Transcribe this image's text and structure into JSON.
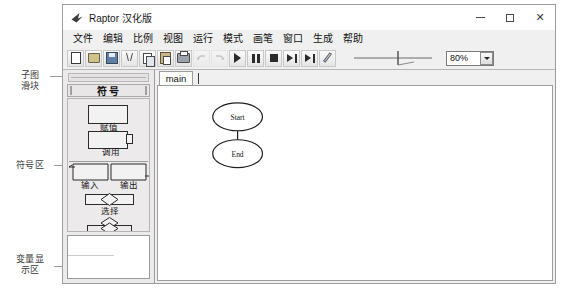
{
  "window": {
    "title": "Raptor 汉化版",
    "icon": "raptor-bird-icon",
    "controls": {
      "minimize": "minimize-icon",
      "maximize": "maximize-icon",
      "close": "✕"
    }
  },
  "menu": {
    "items": [
      {
        "label": "文件",
        "name": "menu-file"
      },
      {
        "label": "编辑",
        "name": "menu-edit"
      },
      {
        "label": "比例",
        "name": "menu-scale"
      },
      {
        "label": "视图",
        "name": "menu-view"
      },
      {
        "label": "运行",
        "name": "menu-run"
      },
      {
        "label": "模式",
        "name": "menu-mode"
      },
      {
        "label": "画笔",
        "name": "menu-pen"
      },
      {
        "label": "窗口",
        "name": "menu-window"
      },
      {
        "label": "生成",
        "name": "menu-generate"
      },
      {
        "label": "帮助",
        "name": "menu-help"
      }
    ]
  },
  "toolbar": {
    "buttons": [
      {
        "name": "new-file-button",
        "icon": "page-icon",
        "enabled": true
      },
      {
        "name": "open-file-button",
        "icon": "folder-open-icon",
        "enabled": true
      },
      {
        "name": "save-button",
        "icon": "floppy-disk-icon",
        "enabled": true
      },
      {
        "name": "cut-button",
        "icon": "scissors-icon",
        "enabled": true
      },
      {
        "name": "copy-button",
        "icon": "copy-icon",
        "enabled": true
      },
      {
        "name": "paste-button",
        "icon": "clipboard-icon",
        "enabled": true
      },
      {
        "name": "print-button",
        "icon": "printer-icon",
        "enabled": true
      },
      {
        "name": "undo-button",
        "icon": "undo-arrow-icon",
        "enabled": false
      },
      {
        "name": "redo-button",
        "icon": "redo-arrow-icon",
        "enabled": false
      },
      {
        "name": "run-button",
        "icon": "play-icon",
        "enabled": true
      },
      {
        "name": "pause-button",
        "icon": "pause-icon",
        "enabled": true
      },
      {
        "name": "stop-button",
        "icon": "stop-icon",
        "enabled": true
      },
      {
        "name": "step-button",
        "icon": "step-over-icon",
        "enabled": true
      },
      {
        "name": "step-into-button",
        "icon": "step-into-icon",
        "enabled": true
      },
      {
        "name": "pen-button",
        "icon": "pencil-icon",
        "enabled": true
      }
    ],
    "speed_slider": {
      "name": "speed-slider",
      "value_percent": 60
    },
    "zoom_select": {
      "value": "80%",
      "name": "zoom-select"
    }
  },
  "left_panel": {
    "subchart_slider_label": "subchart-slider",
    "symbols_header": "符号",
    "symbols": [
      {
        "label": "赋值",
        "shape": "rectangle",
        "name": "symbol-assignment"
      },
      {
        "label": "调用",
        "shape": "rectangle-with-side",
        "name": "symbol-call"
      },
      {
        "label": "输入",
        "shape": "parallelogram-left",
        "name": "symbol-input"
      },
      {
        "label": "输出",
        "shape": "parallelogram-right",
        "name": "symbol-output"
      },
      {
        "label": "选择",
        "shape": "diamond",
        "name": "symbol-selection"
      },
      {
        "label": "循环",
        "shape": "loop",
        "name": "symbol-loop"
      }
    ],
    "variable_area_contents": ""
  },
  "canvas": {
    "tabs": [
      {
        "label": "main",
        "name": "tab-main",
        "active": true
      }
    ],
    "nodes": [
      {
        "label": "Start",
        "name": "node-start",
        "shape": "oval"
      },
      {
        "label": "End",
        "name": "node-end",
        "shape": "oval"
      }
    ]
  },
  "annotations": [
    {
      "text": "子图\n滑块",
      "name": "annotation-subchart-slider"
    },
    {
      "text": "符号区",
      "name": "annotation-symbol-area"
    },
    {
      "text": "变量显\n示区",
      "name": "annotation-variable-area"
    },
    {
      "text": "调速滑块",
      "name": "annotation-speed-slider"
    }
  ]
}
